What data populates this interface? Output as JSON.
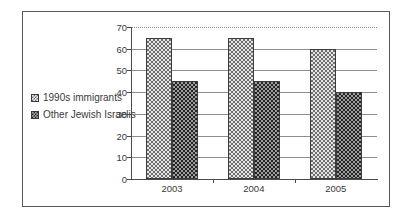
{
  "chart_data": {
    "type": "bar",
    "title": "",
    "xlabel": "",
    "ylabel": "",
    "categories": [
      "2003",
      "2004",
      "2005"
    ],
    "series": [
      {
        "name": "1990s immigrants",
        "values": [
          65,
          65,
          60
        ],
        "pattern": "light-checker"
      },
      {
        "name": "Other Jewish Israelis",
        "values": [
          45,
          45,
          40
        ],
        "pattern": "dark-checker"
      }
    ],
    "ylim": [
      0,
      70
    ],
    "ytick_labels": [
      "70",
      "60",
      "50",
      "40",
      "30",
      "20",
      "10",
      "0"
    ],
    "ytick_values": [
      70,
      60,
      50,
      40,
      30,
      20,
      10,
      0
    ],
    "grid": true,
    "grid_top_dotted": true,
    "legend_position": "left-outside"
  },
  "legend": {
    "items": [
      {
        "label": "1990s immigrants"
      },
      {
        "label": "Other Jewish Israelis"
      }
    ]
  },
  "colors": {
    "frame": "#585858",
    "axis": "#4a4a4a",
    "gridline": "#8d8d8d",
    "text": "#3a3a3a",
    "background": "#ffffff",
    "series_light_fill": "#e4e4e4",
    "series_light_hatch": "#707070",
    "series_dark_fill": "#9d9d9d",
    "series_dark_hatch": "#252525"
  }
}
